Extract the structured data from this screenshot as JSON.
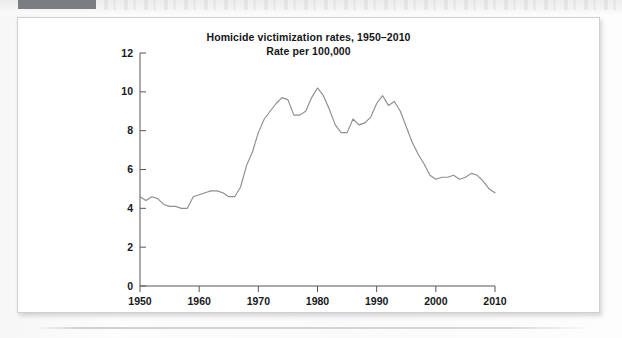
{
  "page": {
    "redaction_bar_color": "#7c7d80",
    "figure_border_color": "#cfd0d2",
    "background_color": "#ffffff"
  },
  "figure": {
    "title_line1": "Homicide victimization rates, 1950–2010",
    "title_line2": "Rate per 100,000"
  },
  "chart_data": {
    "type": "line",
    "title": "Homicide victimization rates, 1950–2010\nRate per 100,000",
    "subtitle": "Rate per 100,000",
    "xlabel": "",
    "ylabel": "",
    "xlim": [
      1950,
      2010
    ],
    "ylim": [
      0,
      12
    ],
    "grid": false,
    "legend": null,
    "line_color": "#8d8e92",
    "x_ticks": [
      1950,
      1960,
      1970,
      1980,
      1990,
      2000,
      2010
    ],
    "x_tick_labels": [
      "1950",
      "1960",
      "1970",
      "1980",
      "1990",
      "2000",
      "2010"
    ],
    "y_ticks": [
      0,
      2,
      4,
      6,
      8,
      10,
      12
    ],
    "y_tick_labels": [
      "0",
      "2",
      "4",
      "6",
      "8",
      "10",
      "12"
    ],
    "series": [
      {
        "name": "Homicide victimization rate per 100,000",
        "x": [
          1950,
          1951,
          1952,
          1953,
          1954,
          1955,
          1956,
          1957,
          1958,
          1959,
          1960,
          1961,
          1962,
          1963,
          1964,
          1965,
          1966,
          1967,
          1968,
          1969,
          1970,
          1971,
          1972,
          1973,
          1974,
          1975,
          1976,
          1977,
          1978,
          1979,
          1980,
          1981,
          1982,
          1983,
          1984,
          1985,
          1986,
          1987,
          1988,
          1989,
          1990,
          1991,
          1992,
          1993,
          1994,
          1995,
          1996,
          1997,
          1998,
          1999,
          2000,
          2001,
          2002,
          2003,
          2004,
          2005,
          2006,
          2007,
          2008,
          2009,
          2010
        ],
        "values": [
          4.6,
          4.4,
          4.6,
          4.5,
          4.2,
          4.1,
          4.1,
          4.0,
          4.0,
          4.6,
          4.7,
          4.8,
          4.9,
          4.9,
          4.8,
          4.6,
          4.6,
          5.1,
          6.2,
          6.9,
          7.9,
          8.6,
          9.0,
          9.4,
          9.7,
          9.6,
          8.8,
          8.8,
          9.0,
          9.7,
          10.2,
          9.8,
          9.1,
          8.3,
          7.9,
          7.9,
          8.6,
          8.3,
          8.4,
          8.7,
          9.4,
          9.8,
          9.3,
          9.5,
          9.0,
          8.2,
          7.4,
          6.8,
          6.3,
          5.7,
          5.5,
          5.6,
          5.6,
          5.7,
          5.5,
          5.6,
          5.8,
          5.7,
          5.4,
          5.0,
          4.8
        ]
      }
    ]
  }
}
